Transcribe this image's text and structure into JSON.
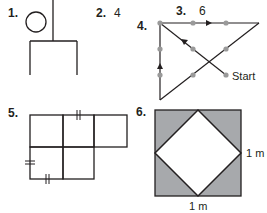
{
  "problems": [
    {
      "number": "1.",
      "type": "figure",
      "description": "circle with T-shaped branching figure"
    },
    {
      "number": "2.",
      "answer": "4"
    },
    {
      "number": "3.",
      "answer": "6"
    },
    {
      "number": "4.",
      "type": "figure",
      "start_label": "Start"
    },
    {
      "number": "5.",
      "type": "figure",
      "description": "five-square grid with congruence tick marks"
    },
    {
      "number": "6.",
      "type": "figure",
      "side_right": "1 m",
      "side_bottom": "1 m"
    }
  ],
  "colors": {
    "line": "#231f20",
    "dot": "#9a9a9a",
    "shade": "#a7a9ac",
    "background": "#ffffff"
  }
}
